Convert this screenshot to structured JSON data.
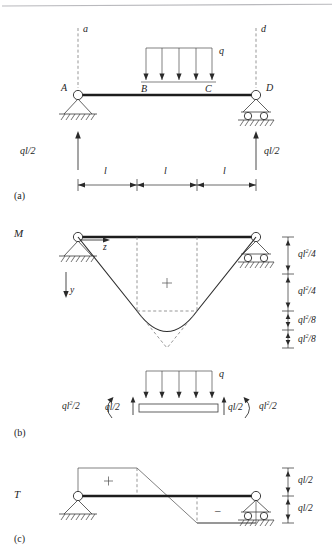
{
  "figure": {
    "title_hidden": "",
    "panels": [
      {
        "key": "a",
        "caption": "(a)",
        "diagram_label": ""
      },
      {
        "key": "b",
        "caption": "(b)",
        "diagram_label": "M"
      },
      {
        "key": "c",
        "caption": "(c)",
        "diagram_label": "T"
      }
    ]
  },
  "panel_a": {
    "caption": "(a)",
    "section_line_left": "a",
    "section_line_right": "d",
    "nodes": {
      "left": "A",
      "load_start": "B",
      "load_end": "C",
      "right": "D"
    },
    "load_label": "q",
    "reaction_left": "ql/2",
    "reaction_right": "ql/2",
    "span_labels": [
      "l",
      "l",
      "l"
    ],
    "load_arrow_count": 5
  },
  "panel_b": {
    "caption": "(b)",
    "diagram_label": "M",
    "axis_z": "z",
    "axis_y": "y",
    "sign": "+",
    "ordinates": [
      "ql2/4",
      "ql2/4",
      "ql2/8",
      "ql2/8"
    ],
    "ordinate_parts": [
      {
        "base": "ql",
        "exp": "2",
        "den": "/4"
      },
      {
        "base": "ql",
        "exp": "2",
        "den": "/4"
      },
      {
        "base": "ql",
        "exp": "2",
        "den": "/8"
      },
      {
        "base": "ql",
        "exp": "2",
        "den": "/8"
      }
    ],
    "fbd": {
      "load_label": "q",
      "moment_left": "ql2/2",
      "moment_right": "ql2/2",
      "shear_left": "ql/2",
      "shear_right": "ql/2",
      "load_arrow_count": 5
    }
  },
  "panel_c": {
    "caption": "(c)",
    "diagram_label": "T",
    "sign_positive": "+",
    "sign_negative": "–",
    "ordinates": [
      "ql/2",
      "ql/2"
    ]
  },
  "colors": {
    "ink": "#1d1d1d",
    "line": "#3a3a3a",
    "dashed": "#6a6a6a",
    "paper": "#ffffff"
  }
}
